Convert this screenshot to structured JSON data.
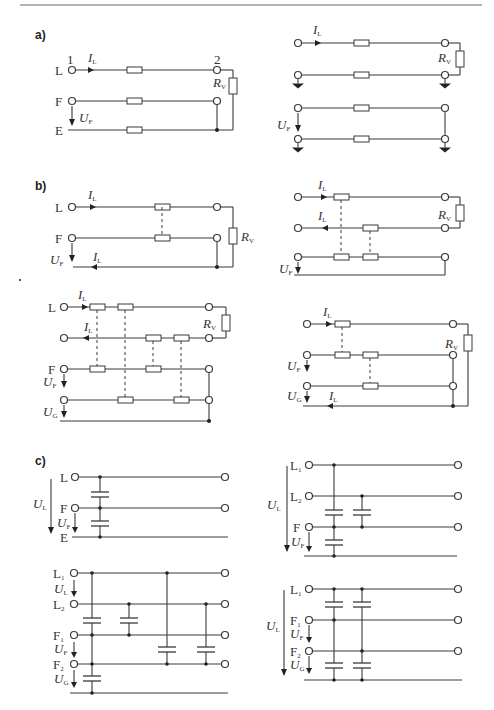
{
  "sections": {
    "a": {
      "label": "a)",
      "left": {
        "node_start": "1",
        "node_end": "2",
        "rows": [
          "L",
          "F",
          "E"
        ],
        "current": {
          "sym": "I",
          "sub": "L"
        },
        "voltage": {
          "sym": "U",
          "sub": "F"
        },
        "load": {
          "sym": "R",
          "sub": "V"
        }
      },
      "right": {
        "current": {
          "sym": "I",
          "sub": "L"
        },
        "voltage": {
          "sym": "U",
          "sub": "F"
        },
        "load": {
          "sym": "R",
          "sub": "V"
        }
      }
    },
    "b": {
      "label": "b)",
      "top_left": {
        "rows": [
          "L",
          "F"
        ],
        "current_in": {
          "sym": "I",
          "sub": "L"
        },
        "current_ret": {
          "sym": "I",
          "sub": "L"
        },
        "voltage": {
          "sym": "U",
          "sub": "F"
        },
        "load": {
          "sym": "R",
          "sub": "V"
        }
      },
      "top_right": {
        "current_in": {
          "sym": "I",
          "sub": "L"
        },
        "current_ret": {
          "sym": "I",
          "sub": "L"
        },
        "voltage": {
          "sym": "U",
          "sub": "F"
        },
        "load": {
          "sym": "R",
          "sub": "V"
        }
      },
      "bottom_left": {
        "rows": [
          "L",
          "F"
        ],
        "current_in": {
          "sym": "I",
          "sub": "L"
        },
        "current_ret": {
          "sym": "I",
          "sub": "L"
        },
        "voltage_f": {
          "sym": "U",
          "sub": "F"
        },
        "voltage_g": {
          "sym": "U",
          "sub": "G"
        },
        "load": {
          "sym": "R",
          "sub": "V"
        }
      },
      "bottom_right": {
        "current_in": {
          "sym": "I",
          "sub": "L"
        },
        "current_ret": {
          "sym": "I",
          "sub": "L"
        },
        "voltage_f": {
          "sym": "U",
          "sub": "F"
        },
        "voltage_g": {
          "sym": "U",
          "sub": "G"
        },
        "load": {
          "sym": "R",
          "sub": "V"
        }
      }
    },
    "c": {
      "label": "c)",
      "top_left": {
        "rows": [
          "L",
          "F",
          "E"
        ],
        "voltage_l": {
          "sym": "U",
          "sub": "L"
        },
        "voltage_f": {
          "sym": "U",
          "sub": "F"
        }
      },
      "top_right": {
        "rows": [
          {
            "sym": "L",
            "sub": "1"
          },
          {
            "sym": "L",
            "sub": "2"
          },
          {
            "sym": "F",
            "sub": ""
          }
        ],
        "voltage_l": {
          "sym": "U",
          "sub": "L"
        },
        "voltage_f": {
          "sym": "U",
          "sub": "F"
        }
      },
      "bottom_left": {
        "rows": [
          {
            "sym": "L",
            "sub": "1"
          },
          {
            "sym": "L",
            "sub": "2"
          },
          {
            "sym": "F",
            "sub": "1"
          },
          {
            "sym": "F",
            "sub": "2"
          }
        ],
        "voltage_l": {
          "sym": "U",
          "sub": "L"
        },
        "voltage_f": {
          "sym": "U",
          "sub": "F"
        },
        "voltage_g": {
          "sym": "U",
          "sub": "G"
        }
      },
      "bottom_right": {
        "rows": [
          {
            "sym": "L",
            "sub": "1"
          },
          {
            "sym": "F",
            "sub": "1"
          },
          {
            "sym": "F",
            "sub": "2"
          }
        ],
        "voltage_l": {
          "sym": "U",
          "sub": "L"
        },
        "voltage_f": {
          "sym": "U",
          "sub": "F"
        },
        "voltage_g": {
          "sym": "U",
          "sub": "G"
        }
      }
    }
  },
  "colors": {
    "line": "#3a3a3a",
    "header_rule": "#9a9a9a",
    "background": "#ffffff"
  }
}
